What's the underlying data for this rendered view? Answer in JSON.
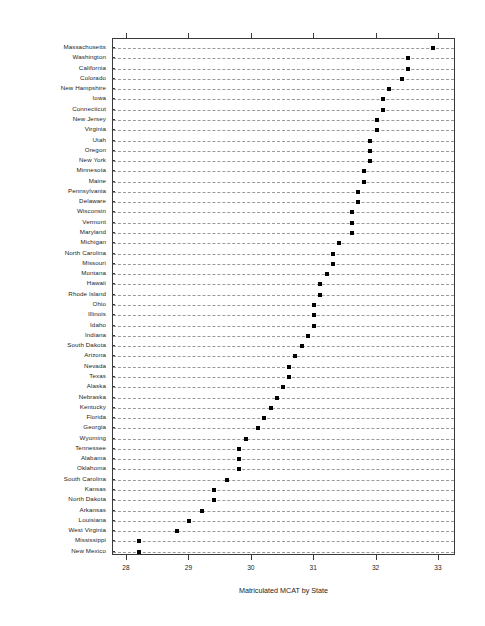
{
  "chart_data": {
    "type": "scatter",
    "title": "",
    "xlabel": "Matriculated MCAT by State",
    "ylabel": "",
    "xlim": [
      27.75,
      33.25
    ],
    "xticks": [
      28,
      29,
      30,
      31,
      32,
      33
    ],
    "xtick_labels": [
      "28",
      "29",
      "30",
      "31",
      "32",
      "33"
    ],
    "grid": "horizontal-dashed",
    "legend": "none",
    "orientation": "horizontal-dotplot",
    "marker": "filled-square",
    "marker_color": "#000000",
    "categories": [
      "Massachusetts",
      "Washington",
      "California",
      "Colorado",
      "New Hampshire",
      "Iowa",
      "Connecticut",
      "New Jersey",
      "Virginia",
      "Utah",
      "Oregon",
      "New York",
      "Minnesota",
      "Maine",
      "Pennsylvania",
      "Delaware",
      "Wisconsin",
      "Vermont",
      "Maryland",
      "Michigan",
      "North Carolina",
      "Missouri",
      "Montana",
      "Hawaii",
      "Rhode Island",
      "Ohio",
      "Illinois",
      "Idaho",
      "Indiana",
      "South Dakota",
      "Arizona",
      "Nevada",
      "Texas",
      "Alaska",
      "Nebraska",
      "Kentucky",
      "Florida",
      "Georgia",
      "Wyoming",
      "Tennessee",
      "Alabama",
      "Oklahoma",
      "South Carolina",
      "Kansas",
      "North Dakota",
      "Arkansas",
      "Louisiana",
      "West Virginia",
      "Mississippi",
      "New Mexico"
    ],
    "values": [
      32.9,
      32.5,
      32.5,
      32.4,
      32.2,
      32.1,
      32.1,
      32.0,
      32.0,
      31.9,
      31.9,
      31.9,
      31.8,
      31.8,
      31.7,
      31.7,
      31.6,
      31.6,
      31.6,
      31.4,
      31.3,
      31.3,
      31.2,
      31.1,
      31.1,
      31.0,
      31.0,
      31.0,
      30.9,
      30.8,
      30.7,
      30.6,
      30.6,
      30.5,
      30.4,
      30.3,
      30.2,
      30.1,
      29.9,
      29.8,
      29.8,
      29.8,
      29.6,
      29.4,
      29.4,
      29.2,
      29.0,
      28.8,
      28.2,
      28.2
    ]
  },
  "axis": {
    "x_title": "Matriculated MCAT by State"
  }
}
